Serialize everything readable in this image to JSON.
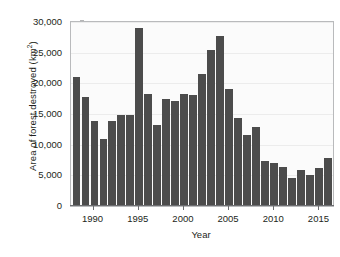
{
  "chart_data": {
    "type": "bar",
    "title": "",
    "xlabel": "Year",
    "ylabel": "Area of forest destroyed (km2)",
    "ylabel_prefix": "Area of forest destroyed (km",
    "ylabel_superscript": "2",
    "ylabel_suffix": ")",
    "categories": [
      1988,
      1989,
      1990,
      1991,
      1992,
      1993,
      1994,
      1995,
      1996,
      1997,
      1998,
      1999,
      2000,
      2001,
      2002,
      2003,
      2004,
      2005,
      2006,
      2007,
      2008,
      2009,
      2010,
      2011,
      2012,
      2013,
      2014,
      2015,
      2016
    ],
    "values": [
      21000,
      17700,
      13800,
      11000,
      13800,
      14900,
      14900,
      29100,
      18200,
      13200,
      17400,
      17200,
      18200,
      18100,
      21500,
      25400,
      27700,
      19000,
      14300,
      11500,
      12900,
      7300,
      7000,
      6400,
      4600,
      5800,
      5000,
      6200,
      7900
    ],
    "ylim": [
      0,
      30000
    ],
    "yticks": [
      0,
      5000,
      10000,
      15000,
      20000,
      25000,
      30000
    ],
    "ytick_labels": [
      "0",
      "5,000",
      "10,000",
      "15,000",
      "20,000",
      "25,000",
      "30,000"
    ],
    "xticks": [
      1990,
      1995,
      2000,
      2005,
      2010,
      2015
    ],
    "xtick_labels": [
      "1990",
      "1995",
      "2000",
      "2005",
      "2010",
      "2015"
    ],
    "grid": true,
    "legend": "none",
    "bar_color": "#4c4c4c",
    "plot_background": "#fbfbfb",
    "axis_color": "#6d6e71"
  }
}
